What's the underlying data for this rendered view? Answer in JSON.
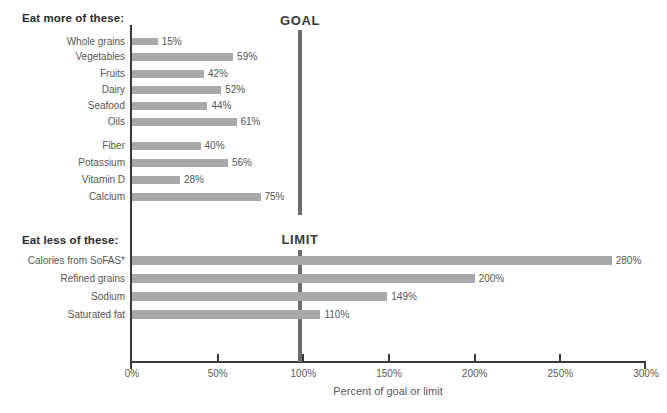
{
  "sections": {
    "more": {
      "title": "Eat more of these:",
      "reference_label": "GOAL"
    },
    "less": {
      "title": "Eat less of these:",
      "reference_label": "LIMIT"
    }
  },
  "axis": {
    "xlabel": "Percent of goal or limit",
    "ticks": [
      "0%",
      "50%",
      "100%",
      "150%",
      "200%",
      "250%",
      "300%"
    ]
  },
  "chart_data": {
    "type": "bar",
    "orientation": "horizontal",
    "title": "",
    "xlabel": "Percent of goal or limit",
    "ylabel": "",
    "xlim": [
      0,
      300
    ],
    "xticks": [
      0,
      50,
      100,
      150,
      200,
      250,
      300
    ],
    "xticklabels": [
      "0%",
      "50%",
      "100%",
      "150%",
      "200%",
      "250%",
      "300%"
    ],
    "grid": false,
    "legend": "none",
    "bar_color": "#a9a9a9",
    "reference_lines": [
      {
        "label": "GOAL",
        "value": 100,
        "group": "Eat more of these:"
      },
      {
        "label": "LIMIT",
        "value": 100,
        "group": "Eat less of these:"
      }
    ],
    "groups": [
      {
        "name": "Eat more of these:",
        "subgroups": [
          {
            "categories": [
              "Whole grains",
              "Vegetables",
              "Fruits",
              "Dairy",
              "Seafood",
              "Oils"
            ],
            "values": [
              15,
              59,
              42,
              52,
              44,
              61
            ],
            "labels": [
              "15%",
              "59%",
              "42%",
              "52%",
              "44%",
              "61%"
            ]
          },
          {
            "categories": [
              "Fiber",
              "Potassium",
              "Vitamin D",
              "Calcium"
            ],
            "values": [
              40,
              56,
              28,
              75
            ],
            "labels": [
              "40%",
              "56%",
              "28%",
              "75%"
            ]
          }
        ]
      },
      {
        "name": "Eat less of these:",
        "subgroups": [
          {
            "categories": [
              "Calories from SoFAS*",
              "Refined grains",
              "Sodium",
              "Saturated fat"
            ],
            "values": [
              280,
              200,
              149,
              110
            ],
            "labels": [
              "280%",
              "200%",
              "149%",
              "110%"
            ]
          }
        ]
      }
    ],
    "all_categories": [
      "Whole grains",
      "Vegetables",
      "Fruits",
      "Dairy",
      "Seafood",
      "Oils",
      "Fiber",
      "Potassium",
      "Vitamin D",
      "Calcium",
      "Calories from SoFAS*",
      "Refined grains",
      "Sodium",
      "Saturated fat"
    ],
    "all_values": [
      15,
      59,
      42,
      52,
      44,
      61,
      40,
      56,
      28,
      75,
      280,
      200,
      149,
      110
    ]
  },
  "rows": [
    {
      "label": "Whole grains",
      "value": 15,
      "value_label": "15%",
      "y": 38,
      "h": 7,
      "section": "more"
    },
    {
      "label": "Vegetables",
      "value": 59,
      "value_label": "59%",
      "y": 53,
      "h": 8,
      "section": "more"
    },
    {
      "label": "Fruits",
      "value": 42,
      "value_label": "42%",
      "y": 70,
      "h": 8,
      "section": "more"
    },
    {
      "label": "Dairy",
      "value": 52,
      "value_label": "52%",
      "y": 86,
      "h": 8,
      "section": "more"
    },
    {
      "label": "Seafood",
      "value": 44,
      "value_label": "44%",
      "y": 102,
      "h": 8,
      "section": "more"
    },
    {
      "label": "Oils",
      "value": 61,
      "value_label": "61%",
      "y": 118,
      "h": 8,
      "section": "more"
    },
    {
      "label": "Fiber",
      "value": 40,
      "value_label": "40%",
      "y": 142,
      "h": 8,
      "section": "more"
    },
    {
      "label": "Potassium",
      "value": 56,
      "value_label": "56%",
      "y": 159,
      "h": 8,
      "section": "more"
    },
    {
      "label": "Vitamin D",
      "value": 28,
      "value_label": "28%",
      "y": 176,
      "h": 8,
      "section": "more"
    },
    {
      "label": "Calcium",
      "value": 75,
      "value_label": "75%",
      "y": 193,
      "h": 8,
      "section": "more"
    },
    {
      "label": "Calories from SoFAS*",
      "value": 280,
      "value_label": "280%",
      "y": 256,
      "h": 9,
      "section": "less"
    },
    {
      "label": "Refined grains",
      "value": 200,
      "value_label": "200%",
      "y": 274,
      "h": 9,
      "section": "less"
    },
    {
      "label": "Sodium",
      "value": 149,
      "value_label": "149%",
      "y": 292,
      "h": 9,
      "section": "less"
    },
    {
      "label": "Saturated fat",
      "value": 110,
      "value_label": "110%",
      "y": 310,
      "h": 9,
      "section": "less"
    }
  ]
}
